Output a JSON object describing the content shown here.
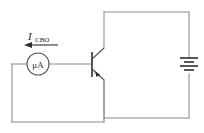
{
  "figure": {
    "name": "transistor-icbo-measurement-circuit",
    "type": "schematic-diagram",
    "width": 204,
    "height": 133,
    "background_color": "#ffffff",
    "wire_color": "#8e8e92",
    "device_color": "#58585c",
    "ink_color": "#1d1d1f"
  },
  "labels": {
    "current_symbol": "I",
    "current_subscript": "CBO",
    "current_full": "ICBO",
    "meter_label": "μA"
  },
  "components": [
    {
      "id": "microammeter",
      "name": "microammeter",
      "label": "μA",
      "shape": "circle",
      "center_x": 38,
      "center_y": 64,
      "radius": 11
    },
    {
      "id": "transistor",
      "name": "npn-transistor",
      "type": "NPN",
      "base_x": 92,
      "base_y": 64,
      "collector_terminal": "top",
      "emitter_terminal": "bottom",
      "emitter_arrow_direction": "outward"
    },
    {
      "id": "battery",
      "name": "battery",
      "type": "multi-cell",
      "center_x": 189,
      "center_y": 66,
      "plate_count": 4,
      "orientation": "vertical"
    }
  ],
  "annotations": [
    {
      "id": "icbo-arrow",
      "name": "current-direction-arrow",
      "points_to": "left",
      "x_start": 56,
      "x_end": 26,
      "y": 45
    }
  ],
  "loops": [
    {
      "id": "base-emitter-loop",
      "name": "meter-loop",
      "contains": [
        "microammeter",
        "transistor-base"
      ]
    },
    {
      "id": "collector-loop",
      "name": "battery-loop",
      "contains": [
        "battery",
        "transistor-collector"
      ]
    }
  ]
}
